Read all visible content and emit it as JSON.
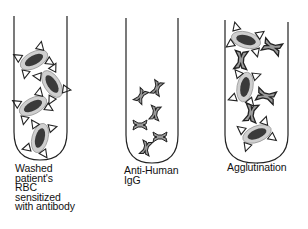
{
  "diagram": {
    "colors": {
      "outline": "#222222",
      "cell_halo": "#cfcfcf",
      "cell_nucleus": "#3a3a3a",
      "antibody_fill": "#9a9a9a",
      "background": "#ffffff"
    },
    "tubes": [
      {
        "id": "tube-1",
        "label": "Washed\npatient's\nRBC\nsensitized\nwith antibody",
        "contents": "red blood cells coated with antibodies",
        "cell_count": 4
      },
      {
        "id": "tube-2",
        "label": "Anti-Human\nIgG",
        "contents": "anti-human IgG antibodies",
        "antibody_count": 6
      },
      {
        "id": "tube-3",
        "label": "Agglutination",
        "contents": "red blood cells cross-linked by anti-human IgG",
        "cell_count": 3,
        "antibody_count": 4
      }
    ]
  }
}
